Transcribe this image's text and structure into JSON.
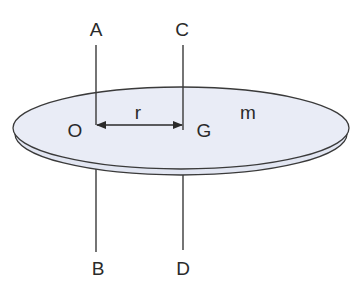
{
  "diagram": {
    "type": "rigid-disc-parallel-axis",
    "colors": {
      "disc_fill": "#e9ecf6",
      "disc_rim_fill": "#e2e6f2",
      "stroke": "#3a3a3a",
      "text": "#2a2a2a",
      "background": "#ffffff"
    },
    "labels": {
      "axis_top_left": "A",
      "axis_bottom_left": "B",
      "axis_top_right": "C",
      "axis_bottom_right": "D",
      "point_o": "O",
      "point_g": "G",
      "distance": "r",
      "mass": "m"
    },
    "axes": [
      {
        "name": "AB",
        "passes_through": "O",
        "top_label": "A",
        "bottom_label": "B"
      },
      {
        "name": "CD",
        "passes_through": "G",
        "top_label": "C",
        "bottom_label": "D"
      }
    ],
    "dimension": {
      "from": "O",
      "to": "G",
      "label": "r",
      "double_headed": true
    }
  }
}
